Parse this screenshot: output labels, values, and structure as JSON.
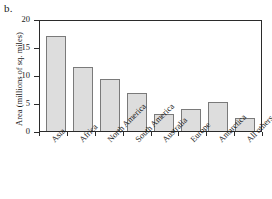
{
  "panel": {
    "label": "b."
  },
  "chart_data": {
    "type": "bar",
    "title": "",
    "xlabel": "",
    "ylabel": "Area (millions of sq. miles)",
    "categories": [
      "Asia",
      "Africa",
      "North America",
      "South America",
      "Australia",
      "Europe",
      "Antarctica",
      "All others"
    ],
    "values": [
      17.3,
      11.6,
      9.4,
      7.0,
      3.1,
      4.0,
      5.3,
      2.3
    ],
    "ylim": [
      0,
      20
    ],
    "yticks": [
      0,
      5,
      10,
      15,
      20
    ],
    "ytick_labels": [
      "0",
      "5",
      "10",
      "15",
      "20"
    ],
    "grid": false,
    "legend": null,
    "bar_fill": "#dddddd",
    "bar_edge": "#7a7a7a",
    "axis_color": "#2b2b2b"
  }
}
